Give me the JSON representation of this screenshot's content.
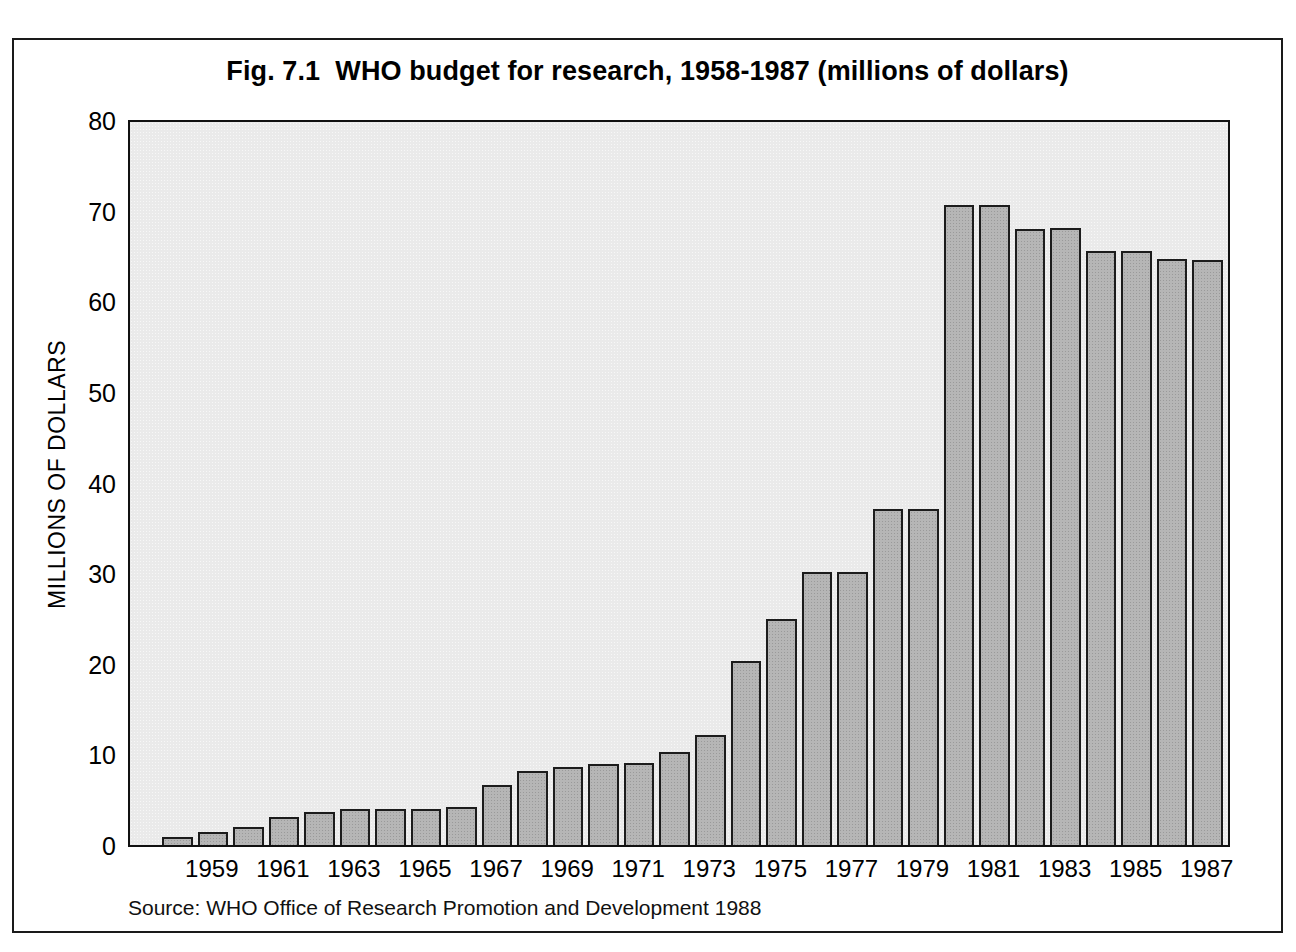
{
  "figure": {
    "title": "Fig. 7.1  WHO budget for research, 1958-1987 (millions of dollars)",
    "source_note": "Source: WHO Office of Research Promotion and Development 1988",
    "frame_color": "#1a1a1a",
    "plot_background": "#eaeaea",
    "bar_fill": "#b6b6b6",
    "bar_outline": "#1c1c1c"
  },
  "chart_data": {
    "type": "bar",
    "title": "Fig. 7.1  WHO budget for research, 1958-1987 (millions of dollars)",
    "xlabel": "",
    "ylabel": "MILLIONS OF DOLLARS",
    "ylim": [
      0,
      80
    ],
    "y_ticks": [
      0,
      10,
      20,
      30,
      40,
      50,
      60,
      70,
      80
    ],
    "y_tick_labels": [
      "0",
      "10",
      "20",
      "30",
      "40",
      "50",
      "60",
      "70",
      "80"
    ],
    "y_minor_tick_step": 2,
    "grid": false,
    "legend": null,
    "units": "millions of dollars",
    "categories": [
      "1958",
      "1959",
      "1960",
      "1961",
      "1962",
      "1963",
      "1964",
      "1965",
      "1966",
      "1967",
      "1968",
      "1969",
      "1970",
      "1971",
      "1972",
      "1973",
      "1974",
      "1975",
      "1976",
      "1977",
      "1978",
      "1979",
      "1980",
      "1981",
      "1982",
      "1983",
      "1984",
      "1985",
      "1986",
      "1987"
    ],
    "values": [
      0.9,
      1.4,
      2.0,
      3.1,
      3.6,
      4.0,
      4.0,
      4.0,
      4.2,
      6.6,
      8.2,
      8.6,
      8.9,
      9.0,
      10.3,
      12.1,
      20.3,
      24.9,
      30.1,
      30.1,
      37.1,
      37.1,
      70.6,
      70.6,
      68.0,
      68.1,
      65.5,
      65.5,
      64.7,
      64.6
    ],
    "x_tick_labels": [
      "1959",
      "1961",
      "1963",
      "1965",
      "1967",
      "1969",
      "1971",
      "1973",
      "1975",
      "1977",
      "1979",
      "1981",
      "1983",
      "1985",
      "1987"
    ],
    "x_tick_categories": [
      "1959",
      "1961",
      "1963",
      "1965",
      "1967",
      "1969",
      "1971",
      "1973",
      "1975",
      "1977",
      "1979",
      "1981",
      "1983",
      "1985",
      "1987"
    ]
  }
}
